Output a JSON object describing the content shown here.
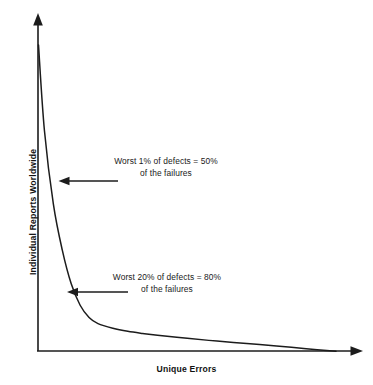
{
  "chart_data": {
    "type": "line",
    "title": "",
    "subtitle": "",
    "xlabel": "Unique Errors",
    "ylabel": "Individual Reports Worldwide",
    "xlim": [
      0,
      100
    ],
    "ylim": [
      0,
      100
    ],
    "grid": false,
    "legend": "none",
    "axis_ticks": "none",
    "series": [
      {
        "name": "Crash report frequency",
        "description": "Long-tail Pareto distribution of individual reports per unique error",
        "x": [
          0,
          2,
          5,
          8,
          11,
          14,
          17,
          20,
          25,
          30,
          35,
          40,
          50,
          60,
          70,
          80,
          90,
          100
        ],
        "values": [
          100,
          72,
          48,
          33,
          22,
          15,
          11,
          9,
          7.5,
          6.5,
          5.8,
          5.2,
          4.2,
          3.3,
          2.5,
          1.7,
          0.8,
          0
        ]
      }
    ],
    "annotations": [
      {
        "id": "annotation-1",
        "line1": "Worst 1% of defects = 50%",
        "line2": "of the failures",
        "points_to_x": 1,
        "points_to_y": 50,
        "arrow_direction": "left"
      },
      {
        "id": "annotation-2",
        "line1": "Worst 20% of defects = 80%",
        "line2": "of the failures",
        "points_to_x": 20,
        "points_to_y": 20,
        "arrow_direction": "left"
      }
    ]
  },
  "colors": {
    "ink": "#1c1c1c",
    "background": "#ffffff",
    "text": "#1a1a1a"
  }
}
